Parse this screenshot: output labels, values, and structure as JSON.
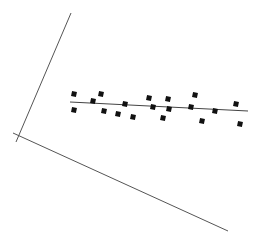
{
  "diagram": {
    "colors": {
      "background": "#ffffff",
      "axis": "#555555",
      "fit_line": "#444444",
      "point": "#111111"
    },
    "axes": {
      "y_axis": {
        "x1": 71,
        "y1": 13,
        "x2": 16,
        "y2": 142
      },
      "x_axis": {
        "x1": 13,
        "y1": 133,
        "x2": 228,
        "y2": 231
      }
    },
    "fit_line": {
      "x1": 70,
      "y1": 102,
      "x2": 248,
      "y2": 111
    },
    "point_size": 5
  },
  "chart_data": {
    "type": "scatter",
    "title": "",
    "xlabel": "",
    "ylabel": "",
    "grid": false,
    "note": "Pixel coordinates of points in the rotated frame",
    "points": [
      {
        "x": 74,
        "y": 94
      },
      {
        "x": 74,
        "y": 110
      },
      {
        "x": 93,
        "y": 101
      },
      {
        "x": 101,
        "y": 94
      },
      {
        "x": 104,
        "y": 111
      },
      {
        "x": 118,
        "y": 114
      },
      {
        "x": 125,
        "y": 104
      },
      {
        "x": 133,
        "y": 117
      },
      {
        "x": 149,
        "y": 98
      },
      {
        "x": 153,
        "y": 107
      },
      {
        "x": 163,
        "y": 118
      },
      {
        "x": 168,
        "y": 99
      },
      {
        "x": 169,
        "y": 109
      },
      {
        "x": 191,
        "y": 107
      },
      {
        "x": 195,
        "y": 95
      },
      {
        "x": 202,
        "y": 121
      },
      {
        "x": 215,
        "y": 111
      },
      {
        "x": 236,
        "y": 104
      },
      {
        "x": 240,
        "y": 124
      }
    ],
    "regression_line": {
      "from": [
        70,
        102
      ],
      "to": [
        248,
        111
      ]
    }
  }
}
